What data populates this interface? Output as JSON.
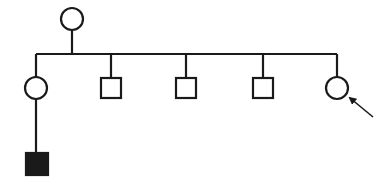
{
  "diagram": {
    "type": "pedigree",
    "stroke_color": "#1a1a1a",
    "fill_affected": "#1a1a1a",
    "fill_unaffected": "#ffffff",
    "generations": [
      {
        "generation": 1,
        "individuals": [
          {
            "id": "I-1",
            "sex": "female",
            "shape": "circle",
            "affected": false,
            "proband": false
          }
        ]
      },
      {
        "generation": 2,
        "individuals": [
          {
            "id": "II-1",
            "sex": "female",
            "shape": "circle",
            "affected": false,
            "proband": false
          },
          {
            "id": "II-2",
            "sex": "male",
            "shape": "square",
            "affected": false,
            "proband": false
          },
          {
            "id": "II-3",
            "sex": "male",
            "shape": "square",
            "affected": false,
            "proband": false
          },
          {
            "id": "II-4",
            "sex": "male",
            "shape": "square",
            "affected": false,
            "proband": false
          },
          {
            "id": "II-5",
            "sex": "female",
            "shape": "circle",
            "affected": false,
            "proband": true
          }
        ]
      },
      {
        "generation": 3,
        "individuals": [
          {
            "id": "III-1",
            "sex": "male",
            "shape": "square",
            "affected": true,
            "proband": false,
            "parent": "II-1"
          }
        ]
      }
    ],
    "proband_marker": "arrow"
  }
}
